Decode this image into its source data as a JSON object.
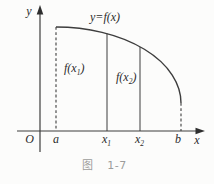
{
  "figure": {
    "caption": {
      "prefix": "图",
      "number": "1-7"
    },
    "curve_label": "y=f(x)",
    "axes": {
      "y_label": "y",
      "x_label": "x",
      "origin_label": "O"
    },
    "region_labels": [
      {
        "pre": "f(x",
        "sub": "1",
        "post": ")"
      },
      {
        "pre": "f(x",
        "sub": "2",
        "post": ")"
      }
    ],
    "ticks": {
      "a": "a",
      "x1": {
        "base": "x",
        "sub": "1"
      },
      "x2": {
        "base": "x",
        "sub": "2"
      },
      "b": "b"
    }
  },
  "colors": {
    "line": "#3d3d3d",
    "text": "#2b2b2b",
    "caption": "#9c9c9c",
    "background": "#fcfcfb"
  }
}
